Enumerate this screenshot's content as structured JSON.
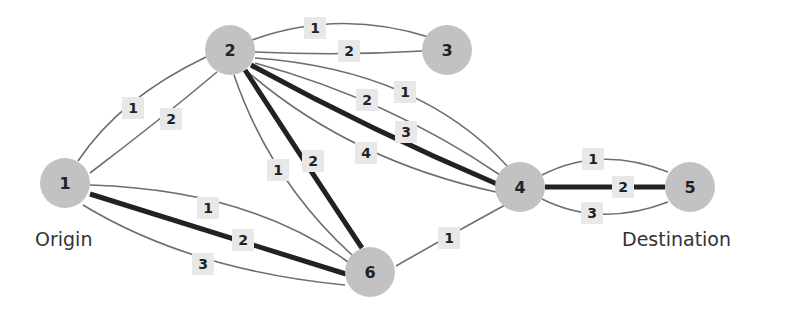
{
  "nodes": [
    {
      "id": "1",
      "label": "1",
      "x": 65,
      "y": 183
    },
    {
      "id": "2",
      "label": "2",
      "x": 230,
      "y": 50
    },
    {
      "id": "3",
      "label": "3",
      "x": 447,
      "y": 50
    },
    {
      "id": "4",
      "label": "4",
      "x": 520,
      "y": 187
    },
    {
      "id": "5",
      "label": "5",
      "x": 690,
      "y": 187
    },
    {
      "id": "6",
      "label": "6",
      "x": 370,
      "y": 272
    }
  ],
  "captions": {
    "origin": "Origin",
    "destination": "Destination"
  },
  "edges": [
    {
      "from": "2",
      "to": "3",
      "label": "1",
      "bold": false
    },
    {
      "from": "2",
      "to": "3",
      "label": "2",
      "bold": false
    },
    {
      "from": "1",
      "to": "2",
      "label": "1",
      "bold": false
    },
    {
      "from": "1",
      "to": "2",
      "label": "2",
      "bold": false
    },
    {
      "from": "2",
      "to": "4",
      "label": "1",
      "bold": false
    },
    {
      "from": "2",
      "to": "4",
      "label": "2",
      "bold": false
    },
    {
      "from": "2",
      "to": "4",
      "label": "3",
      "bold": true
    },
    {
      "from": "2",
      "to": "4",
      "label": "4",
      "bold": false
    },
    {
      "from": "2",
      "to": "6",
      "label": "1",
      "bold": false
    },
    {
      "from": "2",
      "to": "6",
      "label": "2",
      "bold": true
    },
    {
      "from": "1",
      "to": "6",
      "label": "1",
      "bold": false
    },
    {
      "from": "1",
      "to": "6",
      "label": "2",
      "bold": true
    },
    {
      "from": "1",
      "to": "6",
      "label": "3",
      "bold": false
    },
    {
      "from": "6",
      "to": "4",
      "label": "1",
      "bold": false
    },
    {
      "from": "4",
      "to": "5",
      "label": "1",
      "bold": false
    },
    {
      "from": "4",
      "to": "5",
      "label": "2",
      "bold": true
    },
    {
      "from": "4",
      "to": "5",
      "label": "3",
      "bold": false
    }
  ],
  "colors": {
    "node_fill": "#c2c2c2",
    "edge": "#6e6e6e",
    "bold_edge": "#222222",
    "label_bg": "#e8e8e8"
  }
}
